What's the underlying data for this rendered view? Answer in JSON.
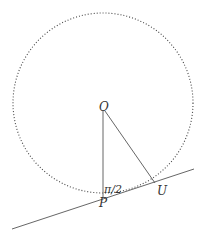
{
  "diagram": {
    "labels": {
      "center": "O",
      "tangent_point": "P",
      "point_u": "U",
      "angle": "π/2"
    },
    "geometry": {
      "circle": {
        "cx": 103,
        "cy": 103,
        "r": 90,
        "style": "dotted"
      },
      "O": [
        103,
        106
      ],
      "P": [
        103,
        197
      ],
      "U": [
        155,
        183
      ],
      "tangent_line": {
        "x1": 12,
        "y1": 229,
        "x2": 194,
        "y2": 169
      }
    },
    "colors": {
      "stroke": "#555555",
      "dots": "#444444"
    }
  }
}
